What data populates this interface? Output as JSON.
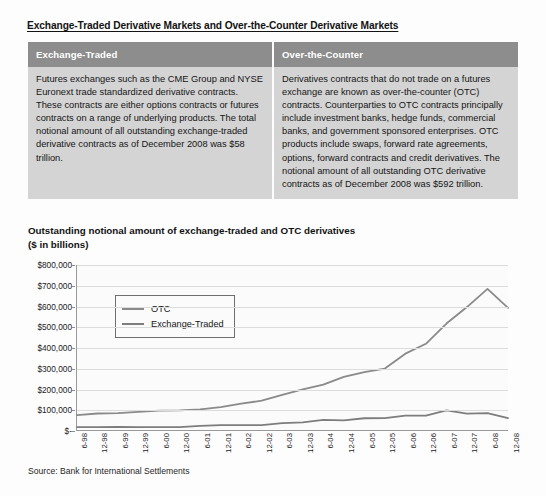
{
  "document": {
    "title": "Exchange-Traded Derivative Markets and Over-the-Counter Derivative Markets",
    "source_note": "Source: Bank for International Settlements"
  },
  "comparison_table": {
    "columns": [
      {
        "header": "Exchange-Traded",
        "body": "Futures exchanges such as the CME Group and NYSE Euronext trade standardized derivative contracts. These contracts are either options contracts or futures contracts on a range of underlying products. The total notional amount of all outstanding exchange-traded derivative contracts as of December 2008 was $58 trillion."
      },
      {
        "header": "Over-the-Counter",
        "body": "Derivatives contracts that do not trade on a futures exchange are known as over-the-counter (OTC) contracts. Counterparties to OTC contracts principally include investment banks, hedge funds, commercial banks, and government sponsored enterprises. OTC products include swaps, forward rate agreements, options, forward contracts and credit derivatives. The notional amount of all outstanding OTC derivative contracts as of December 2008 was $592 trillion."
      }
    ]
  },
  "chart_heading": "Outstanding notional amount of exchange-traded and OTC derivatives\n($ in billions)",
  "chart_data": {
    "type": "line",
    "title": "Outstanding notional amount of exchange-traded and OTC derivatives ($ in billions)",
    "xlabel": "",
    "ylabel": "",
    "ylim": [
      0,
      800000
    ],
    "ytick_values": [
      0,
      100000,
      200000,
      300000,
      400000,
      500000,
      600000,
      700000,
      800000
    ],
    "ytick_labels": [
      "$-",
      "$100,000",
      "$200,000",
      "$300,000",
      "$400,000",
      "$500,000",
      "$600,000",
      "$700,000",
      "$800,000"
    ],
    "grid": true,
    "legend_position": "upper-left",
    "categories": [
      "6-98",
      "12-98",
      "6-99",
      "12-99",
      "6-00",
      "12-00",
      "6-01",
      "12-01",
      "6-02",
      "12-02",
      "6-03",
      "12-03",
      "6-04",
      "12-04",
      "6-05",
      "12-05",
      "6-06",
      "12-06",
      "6-07",
      "12-07",
      "6-08",
      "12-08"
    ],
    "series": [
      {
        "name": "OTC",
        "color": "#8a8a8a",
        "values": [
          72000,
          80000,
          82000,
          88000,
          94000,
          95000,
          100000,
          111000,
          128000,
          142000,
          170000,
          197000,
          220000,
          258000,
          281000,
          298000,
          370000,
          418000,
          516000,
          596000,
          684000,
          592000
        ]
      },
      {
        "name": "Exchange-Traded",
        "color": "#7d7d7d",
        "values": [
          14000,
          13500,
          15000,
          13500,
          14300,
          14200,
          19500,
          23800,
          24000,
          23800,
          33000,
          36700,
          49000,
          46600,
          57000,
          58000,
          70000,
          69400,
          95000,
          79000,
          82000,
          58000
        ]
      }
    ],
    "annotations": []
  }
}
